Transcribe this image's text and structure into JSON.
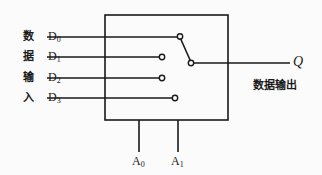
{
  "diagram": {
    "type": "schematic",
    "stroke_color": "#1a1a1a",
    "background_color": "#fbfbfb",
    "input_side_caption_chars": [
      "数",
      "据",
      "输",
      "入"
    ],
    "inputs": [
      {
        "id": "D0",
        "label": "D",
        "subscript": "0",
        "caption_char": "数",
        "y": 37,
        "contact_x": 180,
        "line_start_x": 47
      },
      {
        "id": "D1",
        "label": "D",
        "subscript": "1",
        "caption_char": "据",
        "y": 57,
        "contact_x": 162,
        "line_start_x": 47
      },
      {
        "id": "D2",
        "label": "D",
        "subscript": "2",
        "caption_char": "输",
        "y": 78,
        "contact_x": 162,
        "line_start_x": 47
      },
      {
        "id": "D3",
        "label": "D",
        "subscript": "3",
        "caption_char": "入",
        "y": 98,
        "contact_x": 175,
        "line_start_x": 47
      }
    ],
    "selects": [
      {
        "id": "A0",
        "label": "A",
        "subscript": "0",
        "x": 139
      },
      {
        "id": "A1",
        "label": "A",
        "subscript": "1",
        "x": 178
      }
    ],
    "output": {
      "id": "Q",
      "label": "Q",
      "caption": "数据输出",
      "y": 63,
      "line_end_x": 290
    },
    "box": {
      "x": 105,
      "y": 15,
      "width": 123,
      "height": 105
    },
    "switch": {
      "selected_input": "D0",
      "wiper_from_x": 180,
      "wiper_from_y": 36,
      "wiper_to_x": 191,
      "wiper_to_y": 63
    }
  }
}
